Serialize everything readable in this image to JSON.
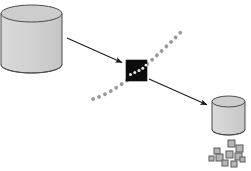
{
  "diagram": {
    "type": "data-flow-diagram",
    "title": "",
    "background_color": "#ffffff",
    "canvas": {
      "width": 251,
      "height": 171
    },
    "palette": {
      "cylinder_fill": "#d2d2d2",
      "cylinder_top_fill": "#c8c8c8",
      "cylinder_stroke": "#4a4a4a",
      "node_fill": "#0d0d0d",
      "arrow_stroke": "#1a1a1a",
      "dotted_path_color": "#9a9a9a",
      "dot_in_node_color": "#e8e8e8",
      "small_square_fill": "#b5b5b5",
      "small_square_stroke": "#5a5a5a"
    },
    "nodes": [
      {
        "id": "source-database",
        "name": "source-database-cylinder",
        "shape": "cylinder",
        "label": "",
        "x": 1,
        "y": 5,
        "width": 61,
        "height": 68,
        "ellipse_ry": 8.5,
        "fill": "#d2d2d2",
        "stroke": "#4a4a4a"
      },
      {
        "id": "processing-node",
        "name": "processing-node-square",
        "shape": "square",
        "label": "",
        "x": 126,
        "y": 60,
        "width": 21,
        "height": 21,
        "fill": "#0d0d0d",
        "stroke": "#0d0d0d"
      },
      {
        "id": "target-database",
        "name": "target-database-cylinder",
        "shape": "cylinder",
        "label": "",
        "x": 212,
        "y": 96,
        "width": 33,
        "height": 39,
        "ellipse_ry": 5.5,
        "fill": "#d2d2d2",
        "stroke": "#4a4a4a"
      }
    ],
    "arrows": [
      {
        "id": "arrow-source-to-node",
        "name": "arrow-source-to-node",
        "label": "",
        "from": "source-database",
        "to": "processing-node",
        "x1": 67,
        "y1": 38,
        "x2": 124,
        "y2": 64,
        "stroke": "#1a1a1a",
        "stroke_width": 1.1,
        "style": "solid",
        "arrowhead": "filled-triangle"
      },
      {
        "id": "arrow-node-to-target",
        "name": "arrow-node-to-target",
        "label": "",
        "from": "processing-node",
        "to": "target-database",
        "x1": 149,
        "y1": 79,
        "x2": 209,
        "y2": 106,
        "stroke": "#1a1a1a",
        "stroke_width": 1.1,
        "style": "solid",
        "arrowhead": "filled-triangle"
      }
    ],
    "dotted_path": {
      "id": "dotted-crossing-path",
      "name": "dotted-crossing-path",
      "label": "",
      "style": "dotted",
      "color": "#9a9a9a",
      "dot_radius": 1.9,
      "start": {
        "x": 93,
        "y": 99
      },
      "control": {
        "x": 128,
        "y": 86
      },
      "end": {
        "x": 181,
        "y": 32
      },
      "passes_through": "processing-node"
    },
    "node_inner_dots": {
      "name": "dotted-path-inside-node",
      "color": "#e8e8e8",
      "count": 5,
      "dot_radius": 1.5
    },
    "small_squares": {
      "name": "output-data-fragments",
      "label": "",
      "fill": "#b5b5b5",
      "stroke": "#5a5a5a",
      "count": 10,
      "items": [
        {
          "x": 228,
          "y": 140,
          "size": 7
        },
        {
          "x": 236,
          "y": 145,
          "size": 7
        },
        {
          "x": 214,
          "y": 148,
          "size": 6
        },
        {
          "x": 226,
          "y": 151,
          "size": 7
        },
        {
          "x": 235,
          "y": 153,
          "size": 7
        },
        {
          "x": 209,
          "y": 156,
          "size": 5
        },
        {
          "x": 216,
          "y": 154,
          "size": 7
        },
        {
          "x": 222,
          "y": 160,
          "size": 6
        },
        {
          "x": 231,
          "y": 161,
          "size": 6
        },
        {
          "x": 240,
          "y": 157,
          "size": 5
        }
      ]
    }
  }
}
